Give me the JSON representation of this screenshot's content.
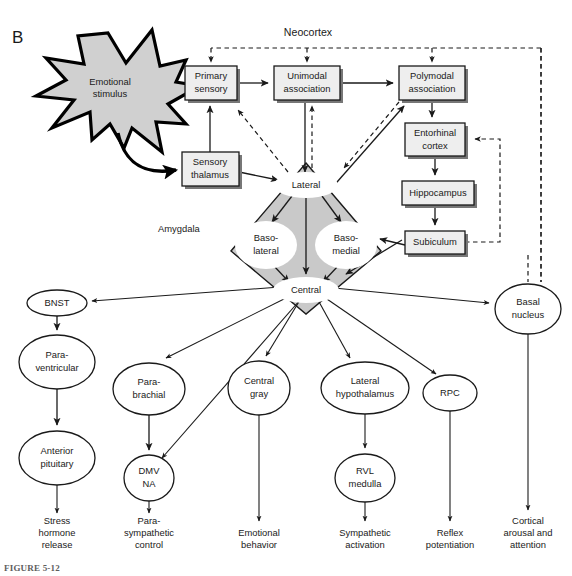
{
  "figure": {
    "panel_letter": "B",
    "caption": "FIGURE 5-12",
    "region_labels": {
      "neocortex": "Neocortex",
      "amygdala": "Amygdala"
    },
    "stimulus": {
      "line1": "Emotional",
      "line2": "stimulus"
    }
  },
  "cortical_boxes": [
    {
      "id": "primary-sensory",
      "line1": "Primary",
      "line2": "sensory",
      "x": 185,
      "y": 66,
      "w": 52,
      "h": 34
    },
    {
      "id": "unimodal-association",
      "line1": "Unimodal",
      "line2": "association",
      "x": 274,
      "y": 66,
      "w": 66,
      "h": 34
    },
    {
      "id": "polymodal-association",
      "line1": "Polymodal",
      "line2": "association",
      "x": 399,
      "y": 66,
      "w": 66,
      "h": 34
    },
    {
      "id": "sensory-thalamus",
      "line1": "Sensory",
      "line2": "thalamus",
      "x": 182,
      "y": 152,
      "w": 57,
      "h": 34
    },
    {
      "id": "entorhinal-cortex",
      "line1": "Entorhinal",
      "line2": "cortex",
      "x": 405,
      "y": 123,
      "w": 60,
      "h": 33
    },
    {
      "id": "hippocampus",
      "line1": "Hippocampus",
      "line2": "",
      "x": 402,
      "y": 181,
      "w": 72,
      "h": 24
    },
    {
      "id": "subiculum",
      "line1": "Subiculum",
      "line2": "",
      "x": 405,
      "y": 231,
      "w": 60,
      "h": 23
    }
  ],
  "amygdala_nuclei": [
    {
      "id": "lateral",
      "line1": "Lateral",
      "line2": "",
      "cx": 306,
      "cy": 185,
      "rx": 30,
      "ry": 12
    },
    {
      "id": "basolateral",
      "line1": "Baso-",
      "line2": "lateral",
      "cx": 266,
      "cy": 245,
      "rx": 28,
      "ry": 21
    },
    {
      "id": "basomedial",
      "line1": "Baso-",
      "line2": "medial",
      "cx": 346,
      "cy": 245,
      "rx": 28,
      "ry": 21
    },
    {
      "id": "central",
      "line1": "Central",
      "line2": "",
      "cx": 306,
      "cy": 290,
      "rx": 31,
      "ry": 12
    }
  ],
  "output_nodes": [
    {
      "id": "bnst",
      "line1": "BNST",
      "line2": "",
      "cx": 57,
      "cy": 303,
      "rx": 30,
      "ry": 13
    },
    {
      "id": "paraventricular",
      "line1": "Para-",
      "line2": "ventricular",
      "cx": 57,
      "cy": 362,
      "rx": 38,
      "ry": 27
    },
    {
      "id": "anterior-pituitary",
      "line1": "Anterior",
      "line2": "pituitary",
      "cx": 57,
      "cy": 458,
      "rx": 38,
      "ry": 27
    },
    {
      "id": "parabrachial",
      "line1": "Para-",
      "line2": "brachial",
      "cx": 149,
      "cy": 389,
      "rx": 36,
      "ry": 26
    },
    {
      "id": "dmv-na",
      "line1": "DMV",
      "line2": "NA",
      "cx": 149,
      "cy": 478,
      "rx": 25,
      "ry": 23
    },
    {
      "id": "central-gray",
      "line1": "Central",
      "line2": "gray",
      "cx": 259,
      "cy": 388,
      "rx": 31,
      "ry": 27
    },
    {
      "id": "lateral-hypothalamus",
      "line1": "Lateral",
      "line2": "hypothalamus",
      "cx": 365,
      "cy": 388,
      "rx": 44,
      "ry": 26
    },
    {
      "id": "rvl-medulla",
      "line1": "RVL",
      "line2": "medulla",
      "cx": 365,
      "cy": 478,
      "rx": 30,
      "ry": 24
    },
    {
      "id": "rpc",
      "line1": "RPC",
      "line2": "",
      "cx": 450,
      "cy": 393,
      "rx": 27,
      "ry": 18
    },
    {
      "id": "basal-nucleus",
      "line1": "Basal",
      "line2": "nucleus",
      "cx": 528,
      "cy": 309,
      "rx": 33,
      "ry": 25
    }
  ],
  "outcome_labels": [
    {
      "id": "stress-hormone-release",
      "cx": 57,
      "y": 521,
      "lines": [
        "Stress",
        "hormone",
        "release"
      ]
    },
    {
      "id": "parasympathetic-control",
      "cx": 149,
      "y": 521,
      "lines": [
        "Para-",
        "sympathetic",
        "control"
      ]
    },
    {
      "id": "emotional-behavior",
      "cx": 259,
      "y": 533,
      "lines": [
        "Emotional",
        "behavior"
      ]
    },
    {
      "id": "sympathetic-activation",
      "cx": 365,
      "y": 533,
      "lines": [
        "Sympathetic",
        "activation"
      ]
    },
    {
      "id": "reflex-potentiation",
      "cx": 450,
      "y": 533,
      "lines": [
        "Reflex",
        "potentiation"
      ]
    },
    {
      "id": "cortical-arousal-attention",
      "cx": 528,
      "y": 521,
      "lines": [
        "Cortical",
        "arousal and",
        "attention"
      ]
    }
  ],
  "colors": {
    "box_fill": "#eeeeee",
    "amygdala_fill": "#c9c9c9",
    "stimulus_fill": "#d0d0d0",
    "stroke": "#1a1a1a",
    "page_background": "#ffffff"
  },
  "connection_types": {
    "solid": "excitatory projection",
    "dashed": "feedback / modulatory projection"
  }
}
